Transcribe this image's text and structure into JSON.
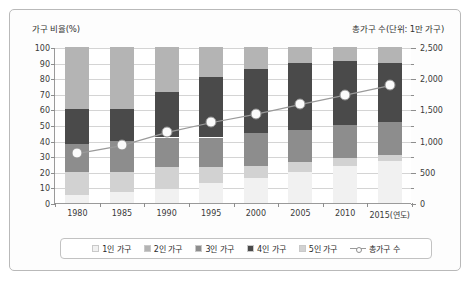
{
  "axis": {
    "left_caption": "가구 비율(%)",
    "right_caption": "총가구 수(단위: 1만 가구)",
    "left_ticks": [
      "100",
      "90",
      "80",
      "70",
      "60",
      "50",
      "40",
      "30",
      "20",
      "10",
      "0"
    ],
    "right_ticks": [
      "2,500",
      "2,000",
      "1,500",
      "1,000",
      "500",
      "0"
    ]
  },
  "legend": {
    "items": [
      {
        "label": "1인 가구",
        "color": "#f1f1f1",
        "marker": "swatch"
      },
      {
        "label": "2인 가구",
        "color": "#b4b4b4",
        "marker": "swatch"
      },
      {
        "label": "3인 가구",
        "color": "#8d8d8d",
        "marker": "swatch"
      },
      {
        "label": "4인 가구",
        "color": "#4a4a4a",
        "marker": "swatch"
      },
      {
        "label": "5인 가구",
        "color": "#d2d2d2",
        "marker": "swatch"
      },
      {
        "label": "총가구 수",
        "color": "#9a9a9a",
        "marker": "line"
      }
    ]
  },
  "chart_data": {
    "type": "bar",
    "subtype": "stacked-bar-with-line",
    "title": "",
    "xlabel": "연도",
    "ylabel": "가구 비율(%)",
    "y2label": "총가구 수(단위: 1만 가구)",
    "categories": [
      "1980",
      "1985",
      "1990",
      "1995",
      "2000",
      "2005",
      "2010",
      "2015(연도)"
    ],
    "ylim": [
      0,
      100
    ],
    "y2lim": [
      0,
      2500
    ],
    "grid": true,
    "legend_position": "bottom",
    "series": [
      {
        "name": "1인 가구",
        "color": "#f1f1f1",
        "values": [
          5,
          7,
          9,
          13,
          16,
          20,
          24,
          27
        ]
      },
      {
        "name": "5인 가구",
        "color": "#d2d2d2",
        "values": [
          15,
          13,
          14,
          10,
          8,
          6,
          5,
          4
        ]
      },
      {
        "name": "3인 가구",
        "color": "#8d8d8d",
        "values": [
          18,
          20,
          19,
          19,
          21,
          21,
          21,
          21
        ]
      },
      {
        "name": "4인 가구",
        "color": "#4a4a4a",
        "values": [
          22,
          20,
          29,
          39,
          41,
          43,
          41,
          38
        ]
      },
      {
        "name": "2인 가구",
        "color": "#b4b4b4",
        "values": [
          40,
          40,
          29,
          19,
          14,
          10,
          9,
          10
        ]
      }
    ],
    "line_series": {
      "name": "총가구 수",
      "color": "#9a9a9a",
      "unit": "1만 가구",
      "values": [
        796,
        926,
        1136,
        1296,
        1431,
        1588,
        1734,
        1890
      ],
      "percent_axis_positions": [
        31.8,
        37.0,
        45.4,
        51.8,
        57.2,
        63.5,
        69.4,
        75.6
      ]
    }
  }
}
